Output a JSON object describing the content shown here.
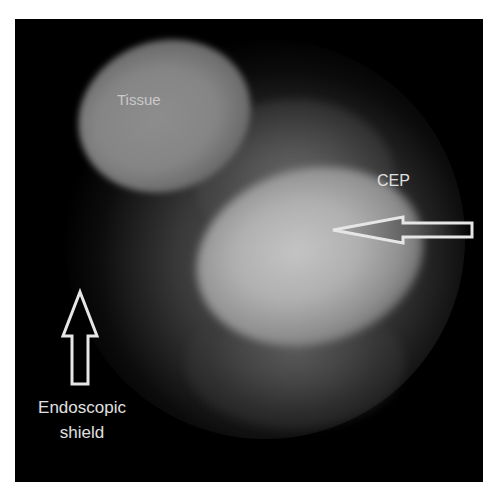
{
  "image": {
    "description": "Endoscopic view showing tissue and CEP (cartilaginous endplate) with annotation arrows",
    "background_color": "#000000",
    "border_color": "#ffffff"
  },
  "labels": {
    "tissue": "Tissue",
    "cep": "CEP",
    "shield_line1": "Endoscopic",
    "shield_line2": "shield"
  },
  "arrows": [
    {
      "name": "cep-arrow",
      "direction": "left",
      "color": "#e6e6e6"
    },
    {
      "name": "shield-arrow",
      "direction": "up",
      "color": "#e6e6e6"
    }
  ]
}
